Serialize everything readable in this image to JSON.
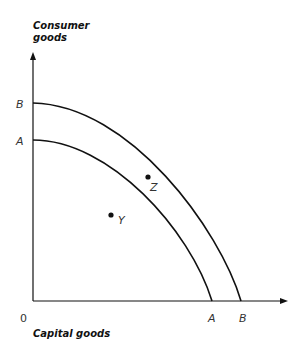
{
  "diagram": {
    "type": "production-possibility-frontier",
    "y_axis_title_line1": "Consumer",
    "y_axis_title_line2": "goods",
    "x_axis_title": "Capital goods",
    "origin_label": "0",
    "curves": [
      {
        "name": "A",
        "y_intercept_label": "A",
        "x_intercept_label": "A"
      },
      {
        "name": "B",
        "y_intercept_label": "B",
        "x_intercept_label": "B"
      }
    ],
    "points": [
      {
        "label": "Y",
        "position": "inside curve A"
      },
      {
        "label": "Z",
        "position": "between curve A and curve B"
      }
    ],
    "colors": {
      "line": "#111111",
      "label": "#333333"
    }
  }
}
